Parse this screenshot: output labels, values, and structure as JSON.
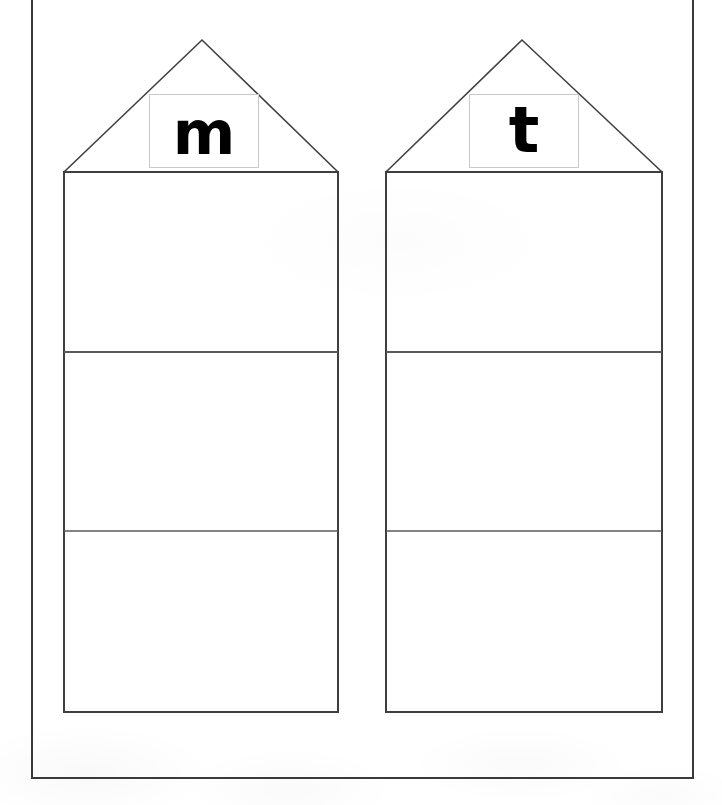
{
  "page": {
    "width": 722,
    "height": 805,
    "background_color": "#ffffff",
    "border_color": "#3a3a3a"
  },
  "border": {
    "name": "outer-page-border",
    "left": 32,
    "right": 693,
    "bottom": 778,
    "stroke_width": 2
  },
  "houses": [
    {
      "id": "house-m",
      "letter": "m",
      "body_left": 64,
      "body_right": 338,
      "eave_y": 172,
      "bottom_y": 712,
      "apex_x": 202,
      "apex_y": 40,
      "dividers": [
        352,
        531
      ],
      "letter_box": {
        "left": 149,
        "top": 94,
        "width": 110,
        "height": 74,
        "border_color": "#c9c9c9"
      }
    },
    {
      "id": "house-t",
      "letter": "t",
      "body_left": 386,
      "body_right": 662,
      "eave_y": 172,
      "bottom_y": 712,
      "apex_x": 522,
      "apex_y": 40,
      "dividers": [
        352,
        531
      ],
      "letter_box": {
        "left": 469,
        "top": 94,
        "width": 110,
        "height": 74,
        "border_color": "#c9c9c9"
      }
    }
  ],
  "strokes": {
    "house_outline_color": "#3f3f3f",
    "house_outline_width": 2,
    "divider_color": "#5a5a5a",
    "divider_width": 2,
    "roof_color": "#404040",
    "roof_width": 1.6
  }
}
